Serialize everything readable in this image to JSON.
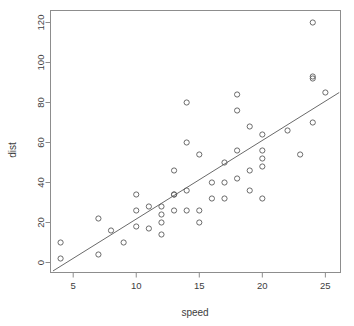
{
  "chart_data": {
    "type": "scatter",
    "title": "",
    "xlabel": "speed",
    "ylabel": "dist",
    "xlim": [
      3.2,
      26.2
    ],
    "ylim": [
      -5,
      126
    ],
    "grid": false,
    "legend": "none",
    "x_ticks": [
      5,
      10,
      15,
      20,
      25
    ],
    "y_ticks": [
      0,
      20,
      40,
      60,
      80,
      100,
      120
    ],
    "x_tick_labels": [
      "5",
      "10",
      "15",
      "20",
      "25"
    ],
    "y_tick_labels": [
      "0",
      "20",
      "40",
      "60",
      "80",
      "100",
      "120"
    ],
    "point_marker": "open-circle",
    "x": [
      4,
      4,
      7,
      7,
      8,
      9,
      10,
      10,
      10,
      11,
      11,
      12,
      12,
      12,
      12,
      13,
      13,
      13,
      13,
      14,
      14,
      14,
      14,
      15,
      15,
      15,
      16,
      16,
      17,
      17,
      17,
      18,
      18,
      18,
      18,
      19,
      19,
      19,
      20,
      20,
      20,
      20,
      20,
      22,
      23,
      24,
      24,
      24,
      24,
      25
    ],
    "y": [
      2,
      10,
      4,
      22,
      16,
      10,
      18,
      26,
      34,
      17,
      28,
      14,
      20,
      24,
      28,
      26,
      34,
      34,
      46,
      26,
      36,
      60,
      80,
      20,
      26,
      54,
      32,
      40,
      32,
      40,
      50,
      42,
      56,
      76,
      84,
      36,
      46,
      68,
      32,
      48,
      52,
      56,
      64,
      66,
      54,
      70,
      92,
      93,
      120,
      85
    ],
    "series": [
      {
        "name": "cars",
        "x": [
          4,
          4,
          7,
          7,
          8,
          9,
          10,
          10,
          10,
          11,
          11,
          12,
          12,
          12,
          12,
          13,
          13,
          13,
          13,
          14,
          14,
          14,
          14,
          15,
          15,
          15,
          16,
          16,
          17,
          17,
          17,
          18,
          18,
          18,
          18,
          19,
          19,
          19,
          20,
          20,
          20,
          20,
          20,
          22,
          23,
          24,
          24,
          24,
          24,
          25
        ],
        "values": [
          2,
          10,
          4,
          22,
          16,
          10,
          18,
          26,
          34,
          17,
          28,
          14,
          20,
          24,
          28,
          26,
          34,
          34,
          46,
          26,
          36,
          60,
          80,
          20,
          26,
          54,
          32,
          40,
          32,
          40,
          50,
          42,
          56,
          76,
          84,
          36,
          46,
          68,
          32,
          48,
          52,
          56,
          64,
          66,
          54,
          70,
          92,
          93,
          120,
          85
        ]
      }
    ],
    "annotations": [
      {
        "kind": "regression-line",
        "intercept": -17.58,
        "slope": 3.93,
        "x_start": 3.4,
        "x_end": 26.1
      }
    ]
  },
  "axes": {
    "x_title": "speed",
    "y_title": "dist"
  }
}
